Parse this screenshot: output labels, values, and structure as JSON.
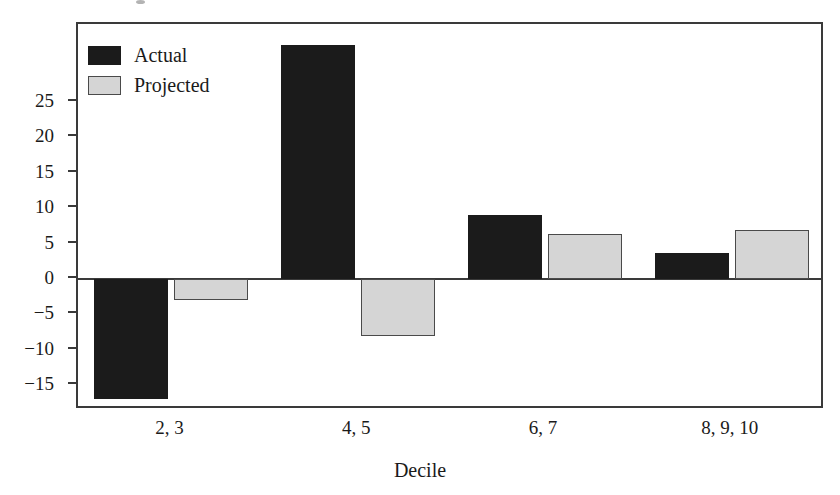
{
  "chart_data": {
    "type": "bar",
    "title": "",
    "xlabel": "Decile",
    "ylabel": "",
    "categories": [
      "2, 3",
      "4, 5",
      "6, 7",
      "8, 9, 10"
    ],
    "series": [
      {
        "name": "Actual",
        "color": "#1b1b1b",
        "values": [
          -17.0,
          33.0,
          9.1,
          3.7
        ]
      },
      {
        "name": "Projected",
        "color": "#d5d5d5",
        "values": [
          -2.9,
          -8.0,
          6.3,
          6.9
        ]
      }
    ],
    "ylim": [
      -18.5,
      36.0
    ],
    "yticks": [
      25,
      20,
      15,
      10,
      5,
      0,
      -5,
      -10,
      -15
    ],
    "ytick_labels": [
      "25",
      "20",
      "15",
      "10",
      "5",
      "0",
      "−5",
      "−10",
      "−15"
    ],
    "grid": false,
    "legend_position": "top-left"
  },
  "axis": {
    "x_title": "Decile"
  },
  "legend": {
    "items": [
      {
        "label": "Actual",
        "swatch": "legend-swatch-actual"
      },
      {
        "label": "Projected",
        "swatch": "legend-swatch-projected"
      }
    ]
  }
}
